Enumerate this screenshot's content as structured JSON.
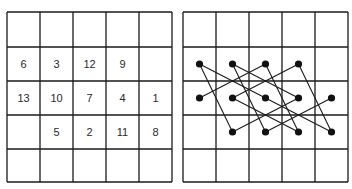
{
  "figure": {
    "grid": {
      "cols": 5,
      "rows": 5
    },
    "left_panel": {
      "description": "Numbered knight tour grid",
      "cells": [
        {
          "label": "6",
          "col": 0,
          "row": 1
        },
        {
          "label": "3",
          "col": 1,
          "row": 1
        },
        {
          "label": "12",
          "col": 2,
          "row": 1
        },
        {
          "label": "9",
          "col": 3,
          "row": 1
        },
        {
          "label": "13",
          "col": 0,
          "row": 2
        },
        {
          "label": "10",
          "col": 1,
          "row": 2
        },
        {
          "label": "7",
          "col": 2,
          "row": 2
        },
        {
          "label": "4",
          "col": 3,
          "row": 2
        },
        {
          "label": "1",
          "col": 4,
          "row": 2
        },
        {
          "label": "5",
          "col": 1,
          "row": 3
        },
        {
          "label": "2",
          "col": 2,
          "row": 3
        },
        {
          "label": "11",
          "col": 3,
          "row": 3
        },
        {
          "label": "8",
          "col": 4,
          "row": 3
        }
      ]
    },
    "right_panel": {
      "description": "Dots connected in numeric order",
      "path_order": [
        "1",
        "2",
        "3",
        "4",
        "5",
        "6",
        "7",
        "8",
        "9",
        "10",
        "11",
        "12",
        "13"
      ]
    },
    "colors": {
      "line": "#1a1a1a",
      "dot": "#111111",
      "background": "#ffffff"
    }
  }
}
